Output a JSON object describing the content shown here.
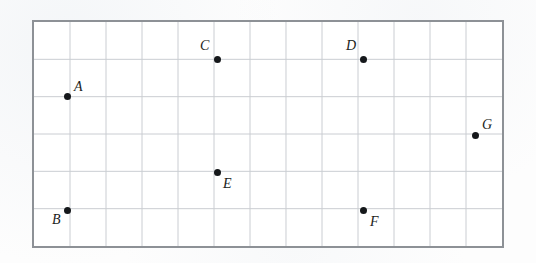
{
  "figure": {
    "type": "scatter-grid-diagram",
    "background_color": "#fdfdfd",
    "plot_background_color": "#ffffff",
    "border_color": "#8d9196",
    "gridline_color": "#c9ccd1",
    "point_color": "#15181b",
    "label_color": "#1b1e21"
  },
  "grid": {
    "left_px": 32,
    "top_px": 20,
    "width_px": 472,
    "height_px": 228,
    "columns": 13,
    "rows": 6,
    "cell_width_px": 36.3,
    "cell_height_px": 38.0,
    "show_axis_labels": false,
    "show_tick_labels": false
  },
  "chart_data": {
    "type": "scatter",
    "title": "",
    "xlabel": "",
    "ylabel": "",
    "grid": true,
    "legend": false,
    "xlim": [
      0,
      13
    ],
    "ylim": [
      0,
      6
    ],
    "point_labels": [
      "A",
      "B",
      "C",
      "D",
      "E",
      "F",
      "G"
    ],
    "points": [
      {
        "label": "A",
        "col": 1,
        "row": 4,
        "x_px": 67,
        "y_px": 96,
        "label_dx": 7,
        "label_dy": -16
      },
      {
        "label": "B",
        "col": 1,
        "row": 1,
        "x_px": 67,
        "y_px": 210,
        "label_dx": -15,
        "label_dy": 3
      },
      {
        "label": "C",
        "col": 5,
        "row": 5,
        "x_px": 217,
        "y_px": 59,
        "label_dx": -17,
        "label_dy": -20
      },
      {
        "label": "D",
        "col": 9,
        "row": 5,
        "x_px": 363,
        "y_px": 59,
        "label_dx": -17,
        "label_dy": -20
      },
      {
        "label": "E",
        "col": 5,
        "row": 2,
        "x_px": 217,
        "y_px": 172,
        "label_dx": 6,
        "label_dy": 5
      },
      {
        "label": "F",
        "col": 9,
        "row": 1,
        "x_px": 363,
        "y_px": 210,
        "label_dx": 7,
        "label_dy": 5
      },
      {
        "label": "G",
        "col": 12,
        "row": 3,
        "x_px": 475,
        "y_px": 135,
        "label_dx": 7,
        "label_dy": -17
      }
    ]
  }
}
